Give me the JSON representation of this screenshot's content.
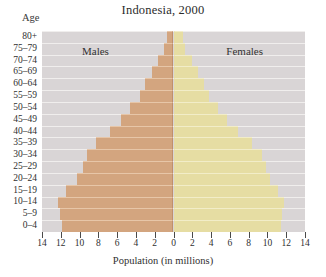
{
  "figure": {
    "title": "Indonesia, 2000",
    "age_caption": "Age",
    "x_caption": "Population (in millions)",
    "male_label": "Males",
    "female_label": "Females",
    "colors": {
      "male_bar": "#d3a57f",
      "female_bar": "#e6dda3",
      "plot_background": "#d9d5d6",
      "gridline": "#f2f0ef",
      "text": "#2f2f2f"
    }
  },
  "chart_data": {
    "type": "bar",
    "subtype": "population-pyramid",
    "title": "Indonesia, 2000",
    "xlabel": "Population (in millions)",
    "ylabel": "Age",
    "orientation": "horizontal",
    "grid": true,
    "legend_position": "in-plot",
    "xlim": [
      -14,
      14
    ],
    "xticks": [
      -14,
      -12,
      -10,
      -8,
      -6,
      -4,
      -2,
      0,
      2,
      4,
      6,
      8,
      10,
      12,
      14
    ],
    "xticklabels": [
      "14",
      "12",
      "10",
      "8",
      "6",
      "4",
      "2",
      "0",
      "2",
      "4",
      "6",
      "8",
      "10",
      "12",
      "14"
    ],
    "categories": [
      "0-4",
      "5-9",
      "10-14",
      "15-19",
      "20-24",
      "25-29",
      "30-34",
      "35-39",
      "40-44",
      "45-49",
      "50-54",
      "55-59",
      "60-64",
      "65-69",
      "70-74",
      "75-79",
      "80+"
    ],
    "series": [
      {
        "name": "Males",
        "color": "#d3a57f",
        "side": "left",
        "values": [
          11.9,
          12.1,
          12.3,
          11.4,
          10.3,
          9.6,
          9.2,
          8.3,
          6.8,
          5.6,
          4.6,
          3.6,
          3.0,
          2.3,
          1.7,
          1.0,
          0.7
        ]
      },
      {
        "name": "Females",
        "color": "#e6dda3",
        "side": "right",
        "values": [
          11.4,
          11.6,
          11.8,
          11.1,
          10.3,
          9.8,
          9.4,
          8.4,
          6.9,
          5.7,
          4.7,
          3.8,
          3.3,
          2.6,
          2.0,
          1.2,
          1.0
        ]
      }
    ]
  }
}
